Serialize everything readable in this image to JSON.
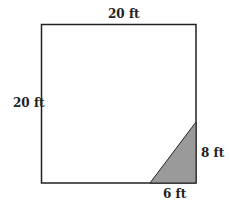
{
  "diagram": {
    "shape": "square with shaded right triangle in lower-right corner",
    "labels": {
      "top": "20 ft",
      "left": "20 ft",
      "triangle_height": "8 ft",
      "triangle_base": "6 ft"
    },
    "colors": {
      "outline": "#222222",
      "shade": "#9a9a9a"
    }
  }
}
